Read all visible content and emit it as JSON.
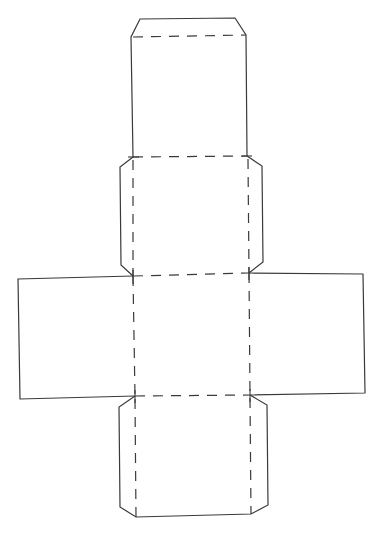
{
  "diagram": {
    "type": "box-net-template",
    "colors": {
      "background": "#ffffff",
      "line": "#3a3a3a"
    },
    "line_styles": {
      "cut": "solid",
      "fold": "dashed"
    },
    "panels": [
      {
        "name": "top-lid-panel",
        "role": "lid with tuck flap"
      },
      {
        "name": "upper-body-panel",
        "role": "face with side glue tabs"
      },
      {
        "name": "center-panel",
        "role": "base face"
      },
      {
        "name": "left-side-panel",
        "role": "side wall"
      },
      {
        "name": "right-side-panel",
        "role": "side wall"
      },
      {
        "name": "bottom-panel",
        "role": "face with side glue tabs"
      }
    ],
    "text_labels": []
  }
}
